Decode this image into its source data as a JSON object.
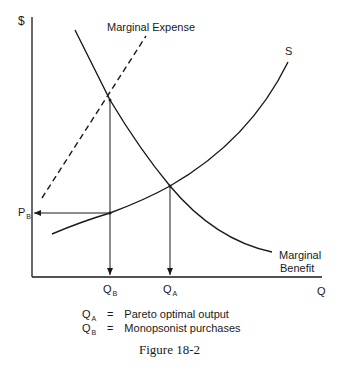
{
  "figure": {
    "caption": "Figure 18-2",
    "y_axis_label": "$",
    "x_axis_label": "Q",
    "curves": {
      "marginal_expense": "Marginal Expense",
      "supply": "S",
      "marginal_benefit_line1": "Marginal",
      "marginal_benefit_line2": "Benefit"
    },
    "points": {
      "price_b": "P",
      "price_b_sub": "B",
      "qty_b": "Q",
      "qty_b_sub": "B",
      "qty_a": "Q",
      "qty_a_sub": "A"
    },
    "legend": [
      {
        "symbol": "Q",
        "sub": "A",
        "eq": "=",
        "text": "Pareto optimal output"
      },
      {
        "symbol": "Q",
        "sub": "B",
        "eq": "=",
        "text": "Monopsonist purchases"
      }
    ]
  }
}
